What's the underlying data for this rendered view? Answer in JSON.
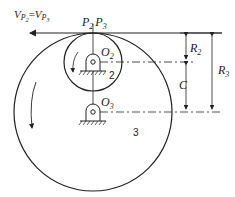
{
  "diagram": {
    "type": "gear-pair-kinematics",
    "velocity_label": {
      "v": "V",
      "s1": "P",
      "s1n": "2",
      "eq": "=",
      "v2": "V",
      "s2": "P",
      "s2n": "3"
    },
    "contact_point_label": {
      "p2": "P",
      "p2n": "2",
      "p3": "P",
      "p3n": "3"
    },
    "pivot_o2": {
      "o": "O",
      "n": "2"
    },
    "pivot_o3": {
      "o": "O",
      "n": "3"
    },
    "gear_small_label": "2",
    "gear_large_label": "3",
    "dimensions": {
      "r2": {
        "r": "R",
        "n": "2"
      },
      "c": "C",
      "r3": {
        "r": "R",
        "n": "3"
      }
    },
    "colors": {
      "stroke": "#222222",
      "background": "#ffffff"
    }
  }
}
